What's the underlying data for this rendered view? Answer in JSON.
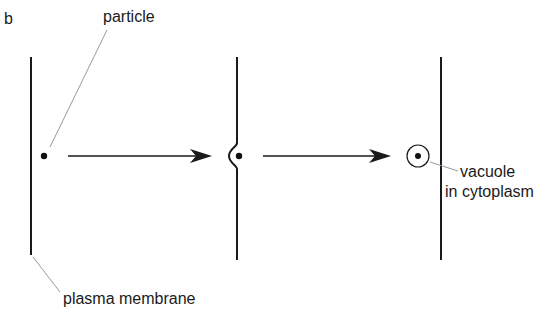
{
  "figure": {
    "panel_label": "b",
    "labels": {
      "particle": "particle",
      "vacuole_line1": "vacuole",
      "vacuole_line2": "in cytoplasm",
      "plasma_membrane": "plasma membrane"
    },
    "stages": [
      {
        "name": "particle-outside-membrane"
      },
      {
        "name": "membrane-invaginating"
      },
      {
        "name": "particle-in-vacuole"
      }
    ],
    "colors": {
      "ink": "#1a1a1a",
      "leader": "#9a9a9a",
      "background": "#ffffff"
    }
  }
}
